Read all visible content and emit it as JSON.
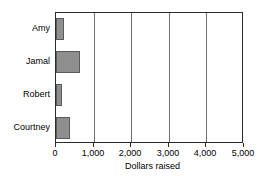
{
  "chart_data": {
    "type": "bar",
    "orientation": "horizontal",
    "title": "",
    "xlabel": "Dollars raised",
    "ylabel": "",
    "categories": [
      "Amy",
      "Jamal",
      "Robert",
      "Courtney"
    ],
    "values": [
      220,
      650,
      150,
      370
    ],
    "xlim": [
      0,
      5000
    ],
    "xticks": [
      0,
      1000,
      2000,
      3000,
      4000,
      5000
    ],
    "xtick_labels": [
      "0",
      "1,000",
      "2,000",
      "3,000",
      "4,000",
      "5,000"
    ],
    "grid": "vertical",
    "legend": "none",
    "series": [
      {
        "name": "Dollars raised",
        "values": [
          220,
          650,
          150,
          370
        ]
      }
    ]
  },
  "style": {
    "bar_fill": "#8f8f8f",
    "bar_stroke": "#5a5a5a",
    "grid_color": "#6f6f6f",
    "frame_color": "#2b2b2b",
    "background": "#ffffff",
    "text_color": "#000000"
  }
}
